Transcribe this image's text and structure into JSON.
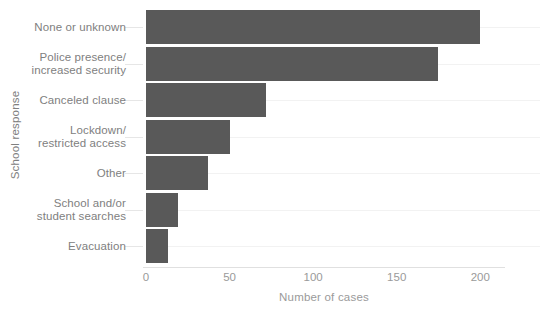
{
  "chart_data": {
    "type": "bar",
    "orientation": "horizontal",
    "title": "",
    "xlabel": "Number of cases",
    "ylabel": "School response",
    "categories": [
      "None or unknown",
      "Police presence/\nincreased security",
      "Canceled clause",
      "Lockdown/\nrestricted access",
      "Other",
      "School and/or\nstudent searches",
      "Evacuation"
    ],
    "values": [
      200,
      175,
      72,
      50,
      37,
      19,
      13
    ],
    "xlim": [
      0,
      213
    ],
    "xticks": [
      0,
      50,
      100,
      150,
      200
    ],
    "xtick_labels": [
      "0",
      "50",
      "100",
      "150",
      "200"
    ],
    "grid": "horizontal",
    "legend": "none",
    "bar_color": "#595959",
    "text_color": "#808080",
    "tick_color": "#9a9a9a",
    "grid_color": "#f2f2f2",
    "background": "#ffffff"
  }
}
